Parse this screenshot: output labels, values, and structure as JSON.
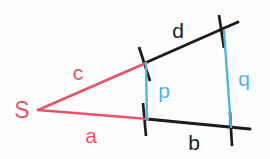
{
  "figure": {
    "background_color": "#fdfdfd",
    "colors": {
      "red": "#e8536a",
      "black": "#1c1c1c",
      "blue": "#4fb3e8"
    },
    "vertex": {
      "label": "S",
      "x": 38,
      "y": 110
    },
    "labels": [
      {
        "id": "c",
        "text": "c",
        "x": 78,
        "y": 72,
        "color": "red",
        "describes": "upper-ray-near-segment"
      },
      {
        "id": "a",
        "text": "a",
        "x": 91,
        "y": 135,
        "color": "red",
        "describes": "lower-ray-near-segment"
      },
      {
        "id": "d",
        "text": "d",
        "x": 178,
        "y": 30,
        "color": "black",
        "describes": "upper-ray-far-segment"
      },
      {
        "id": "b",
        "text": "b",
        "x": 194,
        "y": 142,
        "color": "black",
        "describes": "lower-ray-far-segment"
      },
      {
        "id": "p",
        "text": "p",
        "x": 164,
        "y": 90,
        "color": "blue",
        "describes": "near-parallel-transversal"
      },
      {
        "id": "q",
        "text": "q",
        "x": 244,
        "y": 78,
        "color": "blue",
        "describes": "far-parallel-transversal"
      }
    ],
    "segments": [
      {
        "id": "c",
        "color": "red",
        "x1": 38,
        "y1": 110,
        "x2": 146,
        "y2": 63
      },
      {
        "id": "a",
        "color": "red",
        "x1": 38,
        "y1": 110,
        "x2": 148,
        "y2": 119
      },
      {
        "id": "d",
        "color": "black",
        "x1": 145,
        "y1": 63,
        "x2": 238,
        "y2": 22
      },
      {
        "id": "b",
        "color": "black",
        "x1": 147,
        "y1": 119,
        "x2": 250,
        "y2": 129
      },
      {
        "id": "p",
        "color": "blue",
        "x1": 146,
        "y1": 63,
        "x2": 147,
        "y2": 120
      },
      {
        "id": "q",
        "color": "blue",
        "x1": 224,
        "y1": 31,
        "x2": 231,
        "y2": 127
      }
    ],
    "ticks": [
      {
        "id": "tick-upper-near",
        "x1": 139,
        "y1": 47,
        "x2": 150,
        "y2": 81
      },
      {
        "id": "tick-lower-near",
        "x1": 143,
        "y1": 103,
        "x2": 146,
        "y2": 136
      },
      {
        "id": "tick-upper-far",
        "x1": 219,
        "y1": 15,
        "x2": 224,
        "y2": 48
      },
      {
        "id": "tick-lower-far",
        "x1": 230,
        "y1": 112,
        "x2": 232,
        "y2": 146
      }
    ]
  }
}
